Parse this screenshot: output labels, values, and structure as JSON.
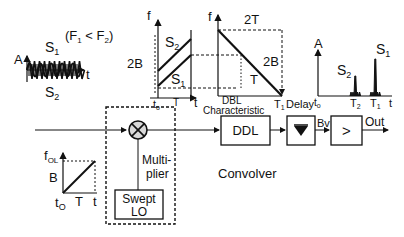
{
  "title": "Convolver",
  "input_signal": {
    "axis_y": "A",
    "axis_x": "t",
    "s1": "S",
    "s1_sub": "1",
    "s2": "S",
    "s2_sub": "2",
    "condition": "(F",
    "condition_sub1": "1",
    "condition_mid": " < F",
    "condition_sub2": "2",
    "condition_end": ")"
  },
  "mixed_plot": {
    "axis_y": "f",
    "axis_x": "t",
    "bandwidth": "2B",
    "period": "T",
    "origin": "t",
    "origin_sub": "o",
    "s2": "S",
    "s2_sub": "2",
    "s1": "S",
    "s1_sub": "1"
  },
  "ddl_plot": {
    "axis_y": "f",
    "width": "2T",
    "bandwidth": "2B",
    "period": "T",
    "caption1": "DBL",
    "caption2": "Characteristic",
    "t1": "T",
    "t1_sub": "1",
    "axis_x": "Delay"
  },
  "output_plot": {
    "axis_y": "A",
    "s2": "S",
    "s2_sub": "2",
    "s1": "S",
    "s1_sub": "1",
    "origin": "t",
    "origin_sub": "o",
    "t2": "T",
    "t2_sub": "2",
    "t1": "T",
    "t1_sub": "1",
    "axis_x": "t"
  },
  "lo_plot": {
    "axis_y": "f",
    "axis_y_sub": "OL",
    "bandwidth": "B",
    "origin": "t",
    "origin_sub": "O",
    "period": "T",
    "axis_x": "t"
  },
  "blocks": {
    "multiplier_label1": "Multi-",
    "multiplier_label2": "plier",
    "swept_lo1": "Swept",
    "swept_lo2": "LO",
    "ddl": "DDL",
    "detector_out": "Bv",
    "amp_symbol": ">",
    "out": "Out"
  }
}
